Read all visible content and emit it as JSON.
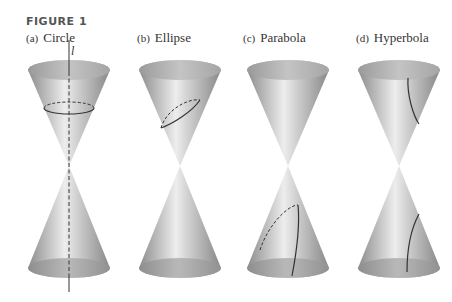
{
  "figure": {
    "title": "FIGURE 1",
    "axis_label": "l",
    "panels": [
      {
        "tag": "(a)",
        "label": "Circle",
        "center_x": 69
      },
      {
        "tag": "(b)",
        "label": "Ellipse",
        "center_x": 180
      },
      {
        "tag": "(c)",
        "label": "Parabola",
        "center_x": 288
      },
      {
        "tag": "(d)",
        "label": "Hyperbola",
        "center_x": 399
      }
    ]
  },
  "colors": {
    "cone_light": "#e6e6e6",
    "cone_mid": "#b5b5b5",
    "cone_dark": "#8c8c8c",
    "rim_inner": "#a0a0a0",
    "curve": "#333333"
  }
}
